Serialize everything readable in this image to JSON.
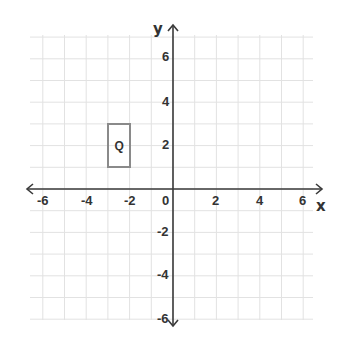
{
  "chart_data": {
    "type": "coordinate_plane",
    "xlabel": "x",
    "ylabel": "y",
    "xlim": [
      -7,
      7
    ],
    "ylim": [
      -6,
      7
    ],
    "grid": true,
    "x_ticks": [
      "-6",
      "-4",
      "-2",
      "0",
      "2",
      "4",
      "6"
    ],
    "y_ticks": [
      "6",
      "4",
      "2",
      "-2",
      "-4",
      "-6"
    ],
    "shapes": [
      {
        "label": "Q",
        "type": "rectangle",
        "vertices": [
          [
            -3,
            1
          ],
          [
            -2,
            1
          ],
          [
            -2,
            3
          ],
          [
            -3,
            3
          ]
        ],
        "color": "#8a8a8a"
      }
    ]
  },
  "axes": {
    "x_label": "x",
    "y_label": "y",
    "x_ticks": [
      {
        "label": "-6",
        "value": -6
      },
      {
        "label": "-4",
        "value": -4
      },
      {
        "label": "-2",
        "value": -2
      },
      {
        "label": "0",
        "value": 0
      },
      {
        "label": "2",
        "value": 2
      },
      {
        "label": "4",
        "value": 4
      },
      {
        "label": "6",
        "value": 6
      }
    ],
    "y_ticks": [
      {
        "label": "6",
        "value": 6
      },
      {
        "label": "4",
        "value": 4
      },
      {
        "label": "2",
        "value": 2
      },
      {
        "label": "-2",
        "value": -2
      },
      {
        "label": "-4",
        "value": -4
      },
      {
        "label": "-6",
        "value": -6
      }
    ]
  },
  "shape_q": {
    "label": "Q"
  }
}
